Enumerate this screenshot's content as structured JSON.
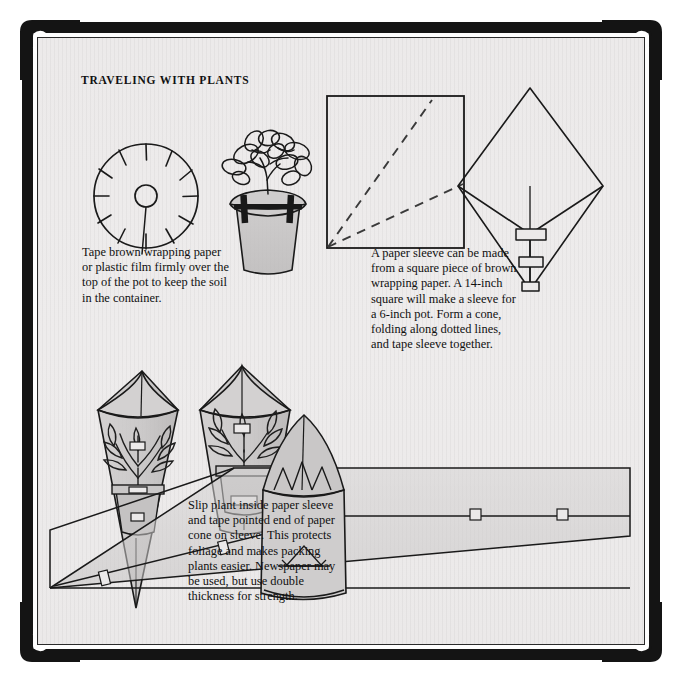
{
  "page": {
    "headline": "TRAVELING WITH PLANTS",
    "paper_color": "#eceaea",
    "frame_color": "#141414",
    "ink_color": "#1a1a1a"
  },
  "captions": [
    {
      "id": "caption-1",
      "lines": [
        "Tape brown wrapping paper",
        "or plastic film firmly over the",
        "top of the pot to keep the soil",
        "in the container."
      ]
    },
    {
      "id": "caption-2",
      "lines": [
        "A paper sleeve can be made",
        "from a square piece of brown",
        "wrapping paper. A 14-inch",
        "square will make a sleeve for",
        "a 6-inch pot. Form a cone,",
        "folding along dotted lines,",
        "and tape sleeve together."
      ]
    },
    {
      "id": "caption-3",
      "lines": [
        "Slip plant inside paper sleeve",
        "and tape pointed end of paper",
        "cone on sleeve. This protects",
        "foliage and makes packing",
        "plants easier. Newspaper may",
        "be used, but use double",
        "thickness for strength."
      ]
    }
  ],
  "figures": [
    {
      "name": "slit-disc-diagram",
      "description": "Circle of wrapping paper with radial slits cut around its edge and a small hole in the center"
    },
    {
      "name": "potted-plant-taped",
      "description": "Leafy potted plant with paper taped over the top of the pot"
    },
    {
      "name": "square-fold-diagram",
      "description": "Square sheet of brown wrapping paper with two dashed fold lines running from the lower-left corner"
    },
    {
      "name": "cone-sleeve-taped",
      "description": "Folded paper cone sleeve with three pieces of tape along the seam"
    },
    {
      "name": "cone-with-plant-pointed",
      "description": "Plant inside a pointed paper cone sleeve"
    },
    {
      "name": "cone-with-plant-flat",
      "description": "Plant inside a paper cone sleeve with a flattened base"
    },
    {
      "name": "wrapped-plant-on-sheet",
      "description": "Wrapped plant standing upright on a flat square of paper with taped fold lines"
    }
  ]
}
